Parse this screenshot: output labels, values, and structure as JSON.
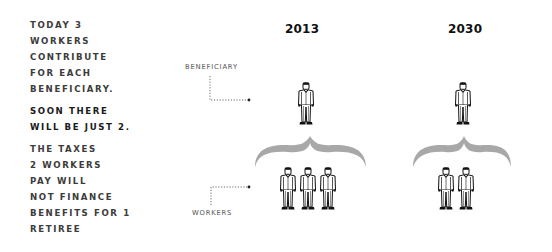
{
  "narrative": {
    "paragraphs": [
      "TODAY 3\nWORKERS\nCONTRIBUTE\nFOR EACH\nBENEFICIARY.",
      "SOON THERE\nWILL BE JUST 2.",
      "THE TAXES\n2 WORKERS\nPAY WILL\nNOT FINANCE\nBENEFITS FOR 1\nRETIREE"
    ]
  },
  "labels": {
    "beneficiary": "BENEFICIARY",
    "workers": "WORKERS"
  },
  "columns": [
    {
      "year": "2013",
      "beneficiaries": 1,
      "workers": 3
    },
    {
      "year": "2030",
      "beneficiaries": 1,
      "workers": 2
    }
  ],
  "colors": {
    "text": "#2b2b2b",
    "brace": "#a8a8a8",
    "figure_stroke": "#111111",
    "leader_line": "#444444"
  },
  "icons": {
    "person": "person-in-suit-icon",
    "brace": "curly-brace-icon"
  }
}
